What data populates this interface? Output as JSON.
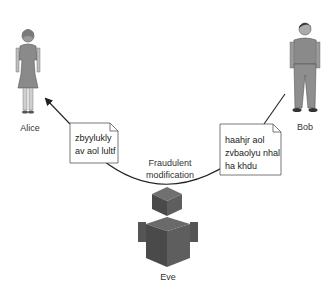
{
  "actors": {
    "alice": {
      "name": "Alice"
    },
    "bob": {
      "name": "Bob"
    },
    "eve": {
      "name": "Eve"
    }
  },
  "notes": {
    "alice_note": {
      "lines": [
        "zbyylukly",
        "av aol lultf"
      ]
    },
    "bob_note": {
      "lines": [
        "haahjr aol",
        "zvbaolyu nhal",
        "ha khdu"
      ]
    }
  },
  "arc_label": {
    "lines": [
      "Fraudulent",
      "modification"
    ]
  },
  "colors": {
    "figure_gray": "#8a8a8a",
    "cube_dark": "#4a4a4a",
    "cube_mid": "#5e5e5e",
    "cube_light": "#707070",
    "line": "#222222"
  }
}
